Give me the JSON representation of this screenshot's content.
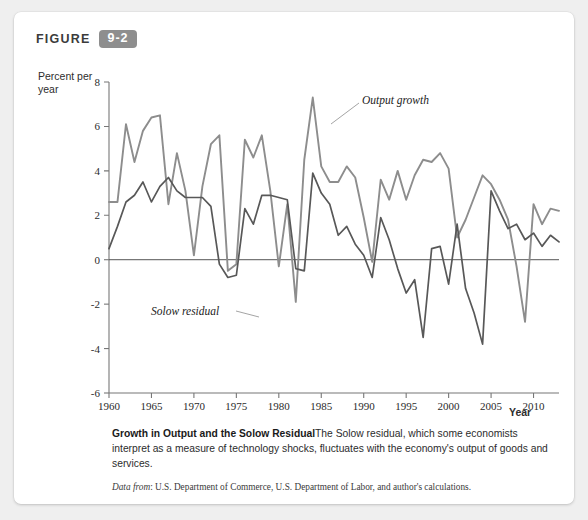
{
  "figure": {
    "word": "FIGURE",
    "number": "9-2"
  },
  "axis_titles": {
    "y": "Percent per year",
    "x": "Year"
  },
  "annotations": {
    "output_growth": "Output growth",
    "solow_residual": "Solow residual"
  },
  "caption": {
    "title": "Growth in Output and the Solow Residual",
    "body": "The Solow residual, which some economists interpret as a measure of technology shocks, fluctuates with the economy's output of goods and services.",
    "source_prefix": "Data from",
    "source_text": ": U.S. Department of Commerce, U.S. Department of Labor, and author's calculations."
  },
  "colors": {
    "badge": "#8e8e8e",
    "output_growth_line": "#8d8d8d",
    "solow_residual_line": "#585858",
    "axis": "#777777",
    "card": "#ffffff",
    "page": "#efefef"
  },
  "chart_data": {
    "type": "line",
    "title": "Growth in Output and the Solow Residual",
    "xlabel": "Year",
    "ylabel": "Percent per year",
    "xlim": [
      1960,
      2013
    ],
    "ylim": [
      -6,
      8
    ],
    "yticks": [
      -6,
      -4,
      -2,
      0,
      2,
      4,
      6,
      8
    ],
    "xticks": [
      1960,
      1965,
      1970,
      1975,
      1980,
      1985,
      1990,
      1995,
      2000,
      2005,
      2010
    ],
    "grid": false,
    "legend": "inline-annotations",
    "x": [
      1960,
      1961,
      1962,
      1963,
      1964,
      1965,
      1966,
      1967,
      1968,
      1969,
      1970,
      1971,
      1972,
      1973,
      1974,
      1975,
      1976,
      1977,
      1978,
      1979,
      1980,
      1981,
      1982,
      1983,
      1984,
      1985,
      1986,
      1987,
      1988,
      1989,
      1990,
      1991,
      1992,
      1993,
      1994,
      1995,
      1996,
      1997,
      1998,
      1999,
      2000,
      2001,
      2002,
      2003,
      2004,
      2005,
      2006,
      2007,
      2008,
      2009,
      2010,
      2011,
      2012,
      2013
    ],
    "series": [
      {
        "name": "Output growth",
        "color": "#8d8d8d",
        "values": [
          2.6,
          2.6,
          6.1,
          4.4,
          5.8,
          6.4,
          6.5,
          2.5,
          4.8,
          3.1,
          0.2,
          3.3,
          5.2,
          5.6,
          -0.5,
          -0.2,
          5.4,
          4.6,
          5.6,
          3.1,
          -0.3,
          2.5,
          -1.9,
          4.5,
          7.3,
          4.2,
          3.5,
          3.5,
          4.2,
          3.7,
          1.9,
          -0.1,
          3.6,
          2.7,
          4.0,
          2.7,
          3.8,
          4.5,
          4.4,
          4.8,
          4.1,
          1.0,
          1.8,
          2.8,
          3.8,
          3.4,
          2.7,
          1.8,
          -0.3,
          -2.8,
          2.5,
          1.6,
          2.3,
          2.2
        ]
      },
      {
        "name": "Solow residual",
        "color": "#585858",
        "values": [
          0.5,
          1.5,
          2.6,
          2.9,
          3.5,
          2.6,
          3.3,
          3.7,
          3.1,
          2.8,
          2.8,
          2.8,
          2.4,
          -0.2,
          -0.8,
          -0.7,
          2.3,
          1.6,
          2.9,
          2.9,
          2.8,
          2.7,
          -0.4,
          -0.5,
          3.9,
          3.0,
          2.5,
          1.1,
          1.5,
          0.7,
          0.2,
          -0.8,
          1.9,
          0.9,
          -0.4,
          -1.5,
          -0.9,
          -3.5,
          0.5,
          0.6,
          -1.1,
          1.6,
          -1.3,
          -2.4,
          -3.8,
          3.1,
          2.2,
          1.4,
          1.6,
          0.9,
          1.2,
          0.6,
          1.1,
          0.8
        ]
      }
    ],
    "note": "Series values read from plotted curve positions against the -6 to 8 axis."
  }
}
